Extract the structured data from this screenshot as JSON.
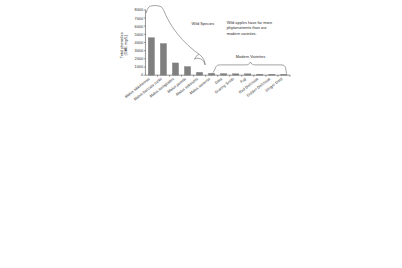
{
  "chart_data": {
    "type": "bar",
    "title": "",
    "xlabel": "",
    "ylabel": "Total phenolics\n(GAE mg/L)",
    "ylabel_line1": "Total phenolics",
    "ylabel_line2": "(GAE mg/L)",
    "ylim": [
      0,
      8000
    ],
    "ytick_labels": [
      "0",
      "1000",
      "2000",
      "3000",
      "4000",
      "5000",
      "6000",
      "7000",
      "8000"
    ],
    "ytick_values": [
      0,
      1000,
      2000,
      3000,
      4000,
      5000,
      6000,
      7000,
      8000
    ],
    "grid": false,
    "legend": "none",
    "bar_color": "#7f7f7f",
    "categories": [
      "Malus sikkimensis",
      "Malus baccata rockii",
      "Malus toringoides",
      "Malus pumila",
      "Malus sylvestris",
      "Malus sieversii",
      "Gala",
      "Granny Smith",
      "Fuji",
      "Red Delicious",
      "Golden Delicious",
      "Ginger Gold"
    ],
    "values": [
      7150,
      4600,
      3880,
      1500,
      1060,
      350,
      230,
      200,
      180,
      170,
      120,
      110
    ],
    "groups": [
      {
        "name": "Wild Species",
        "members": [
          "Malus sikkimensis",
          "Malus baccata rockii",
          "Malus toringoides",
          "Malus pumila",
          "Malus sylvestris",
          "Malus sieversii"
        ],
        "italic": true
      },
      {
        "name": "Modern Varieties",
        "members": [
          "Gala",
          "Granny Smith",
          "Fuji",
          "Red Delicious",
          "Golden Delicious",
          "Ginger Gold"
        ],
        "italic": false
      }
    ],
    "annotations": [
      {
        "name": "wild-species-label",
        "text": "Wild Species"
      },
      {
        "name": "modern-varieties-label",
        "text": "Modern Varieties"
      },
      {
        "name": "callout-note",
        "lines": [
          "Wild apples have far more",
          "phytonutrients than our",
          "modern varieties."
        ]
      }
    ]
  },
  "axis": {
    "y_title_line1": "Total phenolics",
    "y_title_line2": "(GAE mg/L)",
    "ticks": [
      {
        "label": "8000"
      },
      {
        "label": "7000"
      },
      {
        "label": "6000"
      },
      {
        "label": "5000"
      },
      {
        "label": "4000"
      },
      {
        "label": "3000"
      },
      {
        "label": "2000"
      },
      {
        "label": "1000"
      },
      {
        "label": "0"
      }
    ]
  },
  "categories": [
    {
      "label": "Malus sikkimensis"
    },
    {
      "label": "Malus baccata rockii"
    },
    {
      "label": "Malus toringoides"
    },
    {
      "label": "Malus pumila"
    },
    {
      "label": "Malus sylvestris"
    },
    {
      "label": "Malus sieversii"
    },
    {
      "label": "Gala"
    },
    {
      "label": "Granny Smith"
    },
    {
      "label": "Fuji"
    },
    {
      "label": "Red Delicious"
    },
    {
      "label": "Golden Delicious"
    },
    {
      "label": "Ginger Gold"
    }
  ],
  "annotations": {
    "wild_species": "Wild Species",
    "modern_varieties": "Modern Varieties",
    "note_line1": "Wild apples have far more",
    "note_line2": "phytonutrients than our",
    "note_line3": "modern varieties."
  }
}
